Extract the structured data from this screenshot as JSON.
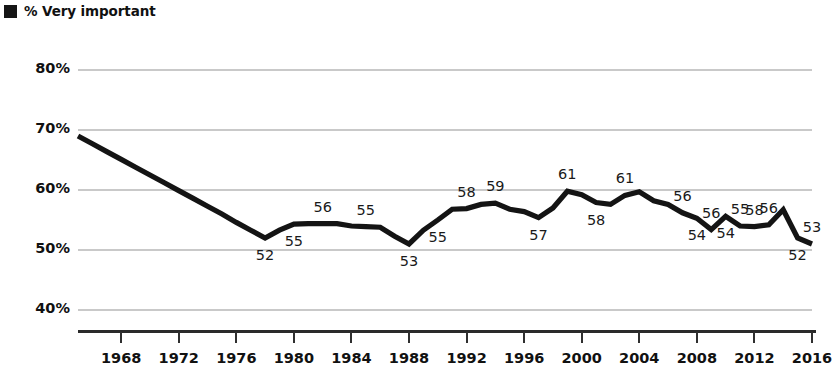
{
  "legend": {
    "marker_color": "#151515",
    "label": "% Very important",
    "marker_icon": "filled-square-icon"
  },
  "chart_data": {
    "type": "line",
    "title": "",
    "subtitle": "",
    "xlabel": "",
    "ylabel": "",
    "grid": true,
    "legend_position": "top-left",
    "xlim": [
      1965,
      2016
    ],
    "ylim": [
      36,
      82
    ],
    "ytick_labels": [
      "80%",
      "70%",
      "60%",
      "50%",
      "40%"
    ],
    "ytick_values": [
      80,
      70,
      60,
      50,
      40
    ],
    "xtick_labels": [
      "1968",
      "1972",
      "1976",
      "1980",
      "1984",
      "1988",
      "1992",
      "1996",
      "2000",
      "2004",
      "2008",
      "2012",
      "2016"
    ],
    "xtick_values": [
      1968,
      1972,
      1976,
      1980,
      1984,
      1988,
      1992,
      1996,
      2000,
      2004,
      2008,
      2012,
      2016
    ],
    "series": [
      {
        "name": "% Very important",
        "color": "#141414",
        "x": [
          1965,
          1966,
          1967,
          1968,
          1969,
          1970,
          1971,
          1972,
          1973,
          1974,
          1975,
          1976,
          1977,
          1978,
          1979,
          1980,
          1981,
          1982,
          1983,
          1984,
          1985,
          1986,
          1987,
          1988,
          1989,
          1990,
          1991,
          1992,
          1993,
          1994,
          1995,
          1996,
          1997,
          1998,
          1999,
          2000,
          2001,
          2002,
          2003,
          2004,
          2005,
          2006,
          2007,
          2008,
          2009,
          2010,
          2011,
          2012,
          2013,
          2014,
          2015,
          2016
        ],
        "y": [
          69.0,
          67.7,
          66.4,
          65.1,
          63.8,
          62.5,
          61.2,
          59.9,
          58.6,
          57.3,
          56.0,
          54.6,
          53.3,
          52.0,
          53.3,
          54.3,
          54.4,
          54.4,
          54.4,
          54.0,
          53.9,
          53.8,
          52.3,
          51.0,
          53.3,
          55.0,
          56.8,
          56.9,
          57.6,
          57.8,
          56.8,
          56.4,
          55.4,
          57.0,
          59.8,
          59.2,
          57.9,
          57.6,
          59.1,
          59.7,
          58.2,
          57.6,
          56.2,
          55.3,
          53.4,
          55.6,
          54.0,
          53.9,
          54.2,
          56.7,
          52.0,
          51.0
        ]
      }
    ],
    "point_labels": [
      {
        "value": "52",
        "x": 1978,
        "position": "below"
      },
      {
        "value": "55",
        "x": 1980,
        "position": "below"
      },
      {
        "value": "56",
        "x": 1982,
        "position": "above"
      },
      {
        "value": "55",
        "x": 1985,
        "position": "above"
      },
      {
        "value": "53",
        "x": 1988,
        "position": "below"
      },
      {
        "value": "55",
        "x": 1990,
        "position": "below"
      },
      {
        "value": "58",
        "x": 1992,
        "position": "above"
      },
      {
        "value": "59",
        "x": 1994,
        "position": "above"
      },
      {
        "value": "57",
        "x": 1997,
        "position": "below"
      },
      {
        "value": "61",
        "x": 1999,
        "position": "above"
      },
      {
        "value": "58",
        "x": 2001,
        "position": "below"
      },
      {
        "value": "61",
        "x": 2003,
        "position": "above"
      },
      {
        "value": "56",
        "x": 2007,
        "position": "above"
      },
      {
        "value": "54",
        "x": 2008,
        "position": "below"
      },
      {
        "value": "56",
        "x": 2009,
        "position": "above"
      },
      {
        "value": "54",
        "x": 2010,
        "position": "below"
      },
      {
        "value": "55",
        "x": 2011,
        "position": "above"
      },
      {
        "value": "58",
        "x": 2012,
        "position": "above"
      },
      {
        "value": "56",
        "x": 2013,
        "position": "above"
      },
      {
        "value": "52",
        "x": 2015,
        "position": "below"
      },
      {
        "value": "53",
        "x": 2016,
        "position": "above"
      }
    ]
  }
}
